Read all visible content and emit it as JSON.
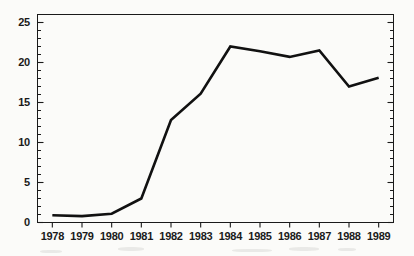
{
  "figure": {
    "background_color": "#fbfbf9",
    "line_color": "#111111",
    "axis_color": "#1a1a1a"
  },
  "chart_data": {
    "type": "line",
    "title": "",
    "subtitle": "",
    "xlabel": "",
    "ylabel": "",
    "categories": [
      "1978",
      "1979",
      "1980",
      "1981",
      "1982",
      "1983",
      "1984",
      "1985",
      "1986",
      "1987",
      "1988",
      "1989"
    ],
    "x": [
      1978,
      1979,
      1980,
      1981,
      1982,
      1983,
      1984,
      1985,
      1986,
      1987,
      1988,
      1989
    ],
    "values": [
      0.9,
      0.8,
      1.1,
      3.0,
      12.8,
      16.1,
      22.0,
      21.4,
      20.7,
      21.5,
      17.0,
      18.1
    ],
    "series": [
      {
        "name": "",
        "values": [
          0.9,
          0.8,
          1.1,
          3.0,
          12.8,
          16.1,
          22.0,
          21.4,
          20.7,
          21.5,
          17.0,
          18.1
        ]
      }
    ],
    "xlim": [
      1977.5,
      1989.5
    ],
    "ylim": [
      0,
      26
    ],
    "ytick_values": [
      0,
      5,
      10,
      15,
      20,
      25
    ],
    "ytick_labels": [
      "0",
      "5",
      "10",
      "15",
      "20",
      "25"
    ],
    "yminor_step": 1,
    "xtick_labels": [
      "1978",
      "1979",
      "1980",
      "1981",
      "1982",
      "1983",
      "1984",
      "1985",
      "1986",
      "1987",
      "1988",
      "1989"
    ],
    "grid": false,
    "legend": null,
    "legend_position": "none",
    "markers": false,
    "annotations": []
  }
}
